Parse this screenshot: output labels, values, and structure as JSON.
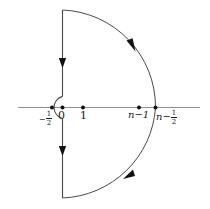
{
  "figure": {
    "type": "complex-plane-contour-diagram",
    "colors": {
      "axis": "#8a8a8a",
      "contour": "#4a4a4a",
      "point": "#111111",
      "label": "#1a1a1a",
      "background": "#ffffff"
    },
    "axis": {
      "name": "real-axis",
      "y": 107,
      "x_start": 18,
      "x_end": 200
    },
    "origin": {
      "x": 62,
      "y": 107
    },
    "radius_large": 93,
    "radius_indent": 11,
    "points": [
      {
        "id": "p-minus-half",
        "x": 52,
        "y": 107,
        "label_main": "−",
        "label_frac_num": "1",
        "label_frac_den": "2",
        "label_text": "−1/2"
      },
      {
        "id": "p-zero",
        "x": 62,
        "y": 107,
        "label_text": "0"
      },
      {
        "id": "p-one",
        "x": 83,
        "y": 107,
        "label_text": "1"
      },
      {
        "id": "p-n-minus-1",
        "x": 139,
        "y": 107,
        "label_text": "n−1"
      },
      {
        "id": "p-n-minus-half",
        "x": 155,
        "y": 107,
        "label_text": "n−1/2"
      }
    ],
    "labels": {
      "minus_half": {
        "minus": "−",
        "num": "1",
        "den": "2",
        "x": 38,
        "y": 113
      },
      "zero": {
        "text": "0",
        "x": 57,
        "y": 112
      },
      "one": {
        "text": "1",
        "x": 79,
        "y": 112
      },
      "n_minus_one": {
        "text": "n−1",
        "x": 129,
        "y": 112
      },
      "n_minus_half_lead": {
        "text": "n−",
        "x": 156,
        "y": 112
      },
      "n_minus_half_frac": {
        "num": "1",
        "den": "2",
        "x": 175,
        "y": 113
      }
    },
    "arrows": [
      {
        "id": "arrow-upper-vertical",
        "direction": "down",
        "x": 62,
        "y": 62
      },
      {
        "id": "arrow-upper-arc",
        "direction": "clockwise-down-right",
        "x": 131,
        "y": 45
      },
      {
        "id": "arrow-lower-vertical",
        "direction": "down",
        "x": 62,
        "y": 150
      },
      {
        "id": "arrow-lower-arc",
        "direction": "counter-up-left",
        "x": 128,
        "y": 173
      }
    ],
    "segments": [
      {
        "id": "upper-vertical-line",
        "from": [
          62,
          10
        ],
        "to": [
          62,
          96
        ]
      },
      {
        "id": "small-indent-semicircle",
        "center": [
          52,
          107
        ],
        "radius": 11,
        "side": "left"
      },
      {
        "id": "lower-vertical-line",
        "from": [
          62,
          118
        ],
        "to": [
          62,
          198
        ]
      },
      {
        "id": "upper-arc",
        "from": [
          62,
          10
        ],
        "to": [
          155,
          107
        ]
      },
      {
        "id": "lower-arc",
        "from": [
          155,
          107
        ],
        "to": [
          62,
          198
        ]
      }
    ]
  }
}
